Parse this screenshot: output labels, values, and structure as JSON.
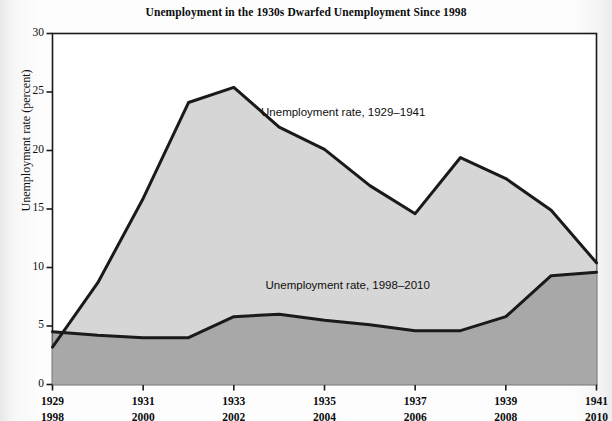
{
  "chart_data": {
    "type": "area",
    "title": "Unemployment in the 1930s Dwarfed Unemployment Since 1998",
    "xlabel": "",
    "ylabel": "Unemployment rate (percent)",
    "ylim": [
      0,
      30
    ],
    "yticks": [
      "0",
      "5",
      "10",
      "15",
      "20",
      "25",
      "30"
    ],
    "ytick_values": [
      0,
      5,
      10,
      15,
      20,
      25,
      30
    ],
    "grid": false,
    "legend": "annotations-inline",
    "x": [
      1929,
      1930,
      1931,
      1932,
      1933,
      1934,
      1935,
      1936,
      1937,
      1938,
      1939,
      1940,
      1941
    ],
    "x_secondary": [
      1998,
      1999,
      2000,
      2001,
      2002,
      2003,
      2004,
      2005,
      2006,
      2007,
      2008,
      2009,
      2010
    ],
    "xticks_top": [
      "1929",
      "1931",
      "1933",
      "1935",
      "1937",
      "1939",
      "1941"
    ],
    "xticks_bottom": [
      "1998",
      "2000",
      "2002",
      "2004",
      "2006",
      "2008",
      "2010"
    ],
    "xtick_values": [
      1929,
      1931,
      1933,
      1935,
      1937,
      1939,
      1941
    ],
    "series": [
      {
        "name": "Unemployment rate, 1929–1941",
        "values": [
          3.2,
          8.7,
          15.9,
          24.1,
          25.4,
          22.0,
          20.1,
          17.0,
          14.6,
          19.4,
          17.6,
          14.9,
          10.4
        ],
        "fill_color": "#d6d6d6",
        "line_color": "#1a1a1a"
      },
      {
        "name": "Unemployment rate, 1998–2010",
        "values": [
          4.5,
          4.2,
          4.0,
          4.0,
          5.8,
          6.0,
          5.5,
          5.1,
          4.6,
          4.6,
          5.8,
          9.3,
          9.6
        ],
        "fill_color": "#a8a8a8",
        "line_color": "#1a1a1a"
      }
    ],
    "annotations": [
      {
        "text": "Unemployment rate, 1929–1941",
        "x": 1933.6,
        "y": 23.2
      },
      {
        "text": "Unemployment rate, 1998–2010",
        "x": 1933.7,
        "y": 8.4
      }
    ]
  },
  "colors": {
    "upper_fill": "#d6d6d6",
    "lower_fill": "#a8a8a8",
    "line": "#1a1a1a",
    "axis": "#1a1a1a",
    "text": "#0d0d0d",
    "page_background": "#fdfdfd"
  }
}
